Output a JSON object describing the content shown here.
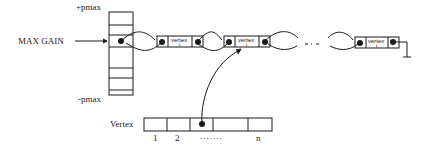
{
  "diagram": {
    "type": "bucket-list data structure",
    "bucket_array": {
      "top_label": "+pmax",
      "bottom_label": "-pmax",
      "pointer_label": "MAX GAIN"
    },
    "linked_list": {
      "node_label": "vertex",
      "node_sublabel": "i",
      "ellipsis": "- - -",
      "nodes_visible": 3
    },
    "vertex_array": {
      "label": "Vertex",
      "index_labels": [
        "1",
        "2",
        ".......",
        "n"
      ]
    }
  }
}
